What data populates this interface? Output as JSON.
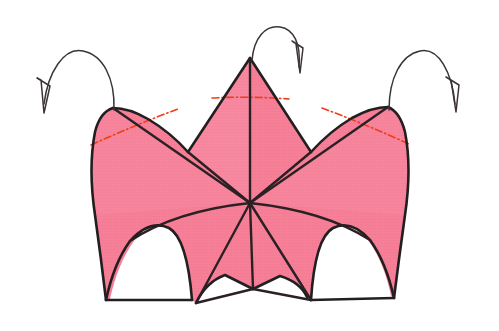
{
  "figure": {
    "title": "Origami crown / lily base folding diagram",
    "canvas": {
      "width": 499,
      "height": 331,
      "background": "#ffffff"
    }
  },
  "colors": {
    "paper_fill": "#f58098",
    "paper_fill_light": "#f79aab",
    "paper_texture": "#ef6d88",
    "outline": "#231f20",
    "fold_line": "#2b2024",
    "crease_red": "#f03c18",
    "crease_red_soft": "#ef5a2a",
    "arrow_stroke": "#3a3438",
    "background": "#ffffff"
  },
  "geometry": {
    "center_vertex": {
      "x": 250,
      "y": 203,
      "name": "central-convergence-point"
    },
    "apex_top": {
      "x": 250,
      "y": 58,
      "name": "top-center-peak"
    },
    "peak_left": {
      "x": 113,
      "y": 108,
      "name": "left-peak"
    },
    "peak_right": {
      "x": 388,
      "y": 107,
      "name": "right-peak"
    },
    "bottom_left_tip": {
      "x": 106,
      "y": 300,
      "name": "bottom-left-tip"
    },
    "bottom_right_tip": {
      "x": 394,
      "y": 298,
      "name": "bottom-right-tip"
    },
    "bottom_center_tip": {
      "x": 253,
      "y": 289,
      "name": "bottom-center-tip"
    },
    "inner_left_tip": {
      "x": 196,
      "y": 303,
      "name": "inner-left-tip"
    },
    "inner_right_tip": {
      "x": 311,
      "y": 300,
      "name": "inner-right-tip"
    },
    "valley_left": {
      "x": 186,
      "y": 152,
      "name": "left-valley-notch"
    },
    "valley_right": {
      "x": 312,
      "y": 152,
      "name": "right-valley-notch"
    }
  },
  "paper_panels": [
    {
      "id": "panel-center-spire",
      "label": "Center spire triangle"
    },
    {
      "id": "panel-left-wing",
      "label": "Left wing panel"
    },
    {
      "id": "panel-right-wing",
      "label": "Right wing panel"
    },
    {
      "id": "panel-lower-left-skirt",
      "label": "Lower left skirt"
    },
    {
      "id": "panel-lower-right-skirt",
      "label": "Lower right skirt"
    }
  ],
  "fold_lines": [
    {
      "id": "fold-center-vertical",
      "type": "mountain",
      "label": "Center vertical mountain fold"
    },
    {
      "id": "fold-center-left-diagonal",
      "type": "mountain",
      "label": "Center-left diagonal fold"
    },
    {
      "id": "fold-center-right-diagonal",
      "type": "mountain",
      "label": "Center-right diagonal fold"
    },
    {
      "id": "fold-left-wing-spine",
      "type": "mountain",
      "label": "Left wing spine fold"
    },
    {
      "id": "fold-right-wing-spine",
      "type": "mountain",
      "label": "Right wing spine fold"
    },
    {
      "id": "fold-lower-left-rib",
      "type": "valley",
      "label": "Lower left rib fold"
    },
    {
      "id": "fold-lower-right-rib",
      "type": "valley",
      "label": "Lower right rib fold"
    },
    {
      "id": "fold-bottom-left-seam",
      "type": "mountain",
      "label": "Bottom left seam"
    },
    {
      "id": "fold-bottom-right-seam",
      "type": "mountain",
      "label": "Bottom right seam"
    }
  ],
  "crease_marks": [
    {
      "id": "crease-left",
      "style": "dash-dot",
      "color": "#f03c18",
      "label": "Left red dash-dot crease"
    },
    {
      "id": "crease-center",
      "style": "dash-dot",
      "color": "#f03c18",
      "label": "Center red dash-dot crease"
    },
    {
      "id": "crease-right",
      "style": "dash-dot",
      "color": "#f03c18",
      "label": "Right red dash-dot crease"
    }
  ],
  "fold_arrows": [
    {
      "id": "arrow-left",
      "label": "Left fold-over arrow",
      "direction": "from left peak arcing left and down",
      "head": "open-barb",
      "tail_anchor": {
        "x": 113,
        "y": 110
      },
      "head_tip": {
        "x": 44,
        "y": 113
      }
    },
    {
      "id": "arrow-center",
      "label": "Center fold-over arrow",
      "direction": "from top apex arcing right and down",
      "head": "open-barb",
      "tail_anchor": {
        "x": 252,
        "y": 60
      },
      "head_tip": {
        "x": 299,
        "y": 70
      }
    },
    {
      "id": "arrow-right",
      "label": "Right fold-over arrow",
      "direction": "from right peak arcing right and down",
      "head": "open-barb",
      "tail_anchor": {
        "x": 389,
        "y": 110
      },
      "head_tip": {
        "x": 455,
        "y": 112
      }
    }
  ]
}
